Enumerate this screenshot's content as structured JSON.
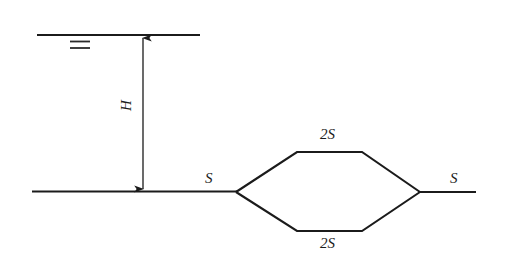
{
  "figure": {
    "title": "",
    "type": "line-diagram",
    "background_color": "#ffffff",
    "stroke_color": "#1b1b1b",
    "labels": {
      "head": "H",
      "section_left": "S",
      "section_top_branch": "2S",
      "section_bottom_branch": "2S",
      "section_right": "S"
    },
    "elements": {
      "upper_level_line": "upper-horizontal-line",
      "equals_mark": "double-dash-mark",
      "head_arrow": "double-headed-vertical-arrow",
      "baseline": "lower-horizontal-line",
      "branch_shape": "hexagonal-branch-loop",
      "outlet_line": "right-horizontal-line"
    },
    "geometry": {
      "upper_line": {
        "x1": 37,
        "y1": 35,
        "x2": 200,
        "y2": 35
      },
      "equals_dash_1": {
        "x1": 70,
        "y1": 41,
        "x2": 90,
        "y2": 41
      },
      "equals_dash_2": {
        "x1": 70,
        "y1": 47,
        "x2": 90,
        "y2": 47
      },
      "arrow": {
        "x": 143,
        "y_top": 36,
        "y_bottom": 191
      },
      "baseline": {
        "x1": 32,
        "y1": 191,
        "x2": 236,
        "y2": 191
      },
      "hexagon": {
        "left_vertex": [
          236,
          192
        ],
        "top_left_bend": [
          297,
          152
        ],
        "top_right_bend": [
          362,
          152
        ],
        "right_vertex": [
          420,
          192
        ],
        "bottom_right_bend": [
          362,
          231
        ],
        "bottom_left_bend": [
          297,
          231
        ]
      },
      "outlet_line": {
        "x1": 420,
        "y1": 192,
        "x2": 476,
        "y2": 192
      }
    },
    "label_positions": {
      "head": [
        127,
        98
      ],
      "section_left": [
        205,
        172
      ],
      "section_top_branch": [
        324,
        128
      ],
      "section_bottom_branch": [
        324,
        236
      ],
      "section_right": [
        451,
        172
      ]
    }
  }
}
